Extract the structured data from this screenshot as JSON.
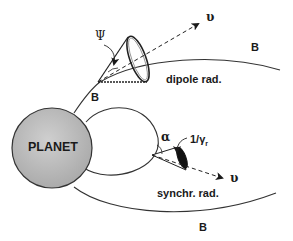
{
  "diagram": {
    "planet": {
      "label": "PLANET",
      "fill_color": "#b8b8b8",
      "stroke_color": "#333333"
    },
    "field_lines": {
      "label_upper_left": "B",
      "label_upper_right": "B",
      "label_bottom": "B"
    },
    "dipole_emission": {
      "label": "dipole rad.",
      "cone_angle_symbol": "Ψ",
      "velocity_symbol": "υ"
    },
    "synchrotron_emission": {
      "label": "synchr. rad.",
      "pitch_angle_symbol": "α",
      "cone_angle_symbol": "1/γ",
      "cone_angle_subscript": "r",
      "velocity_symbol": "υ"
    }
  }
}
